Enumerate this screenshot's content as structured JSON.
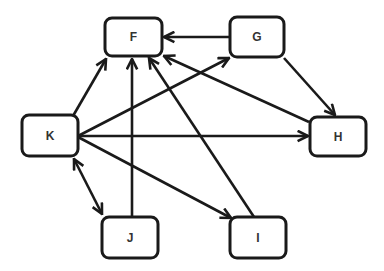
{
  "diagram": {
    "type": "directed-graph",
    "colors": {
      "stroke": "#1a1a1a",
      "node_fill": "#ffffff",
      "label": "#333333",
      "background": "#ffffff"
    },
    "nodes": [
      {
        "id": "F",
        "label": "F",
        "x": 105,
        "y": 18,
        "w": 57,
        "h": 38
      },
      {
        "id": "G",
        "label": "G",
        "x": 230,
        "y": 17,
        "w": 54,
        "h": 40
      },
      {
        "id": "K",
        "label": "K",
        "x": 22,
        "y": 115,
        "w": 56,
        "h": 41
      },
      {
        "id": "H",
        "label": "H",
        "x": 310,
        "y": 117,
        "w": 56,
        "h": 39
      },
      {
        "id": "J",
        "label": "J",
        "x": 102,
        "y": 217,
        "w": 56,
        "h": 41
      },
      {
        "id": "I",
        "label": "I",
        "x": 230,
        "y": 217,
        "w": 56,
        "h": 41
      }
    ],
    "edges": [
      {
        "from": "K",
        "to": "F",
        "x1": 73,
        "y1": 116,
        "x2": 106,
        "y2": 59,
        "bidirectional": false
      },
      {
        "from": "K",
        "to": "G",
        "x1": 78,
        "y1": 136,
        "x2": 229,
        "y2": 58,
        "bidirectional": false
      },
      {
        "from": "G",
        "to": "F",
        "x1": 230,
        "y1": 37,
        "x2": 164,
        "y2": 37,
        "bidirectional": false
      },
      {
        "from": "G",
        "to": "H",
        "x1": 284,
        "y1": 58,
        "x2": 335,
        "y2": 115,
        "bidirectional": false
      },
      {
        "from": "H",
        "to": "F",
        "x1": 309,
        "y1": 122,
        "x2": 164,
        "y2": 56,
        "bidirectional": false
      },
      {
        "from": "K",
        "to": "H",
        "x1": 78,
        "y1": 136,
        "x2": 308,
        "y2": 136,
        "bidirectional": false
      },
      {
        "from": "K",
        "to": "J",
        "x1": 74,
        "y1": 159,
        "x2": 102,
        "y2": 214,
        "bidirectional": true
      },
      {
        "from": "K",
        "to": "I",
        "x1": 78,
        "y1": 137,
        "x2": 231,
        "y2": 218,
        "bidirectional": false
      },
      {
        "from": "J",
        "to": "F",
        "x1": 132,
        "y1": 217,
        "x2": 132,
        "y2": 59,
        "bidirectional": false
      },
      {
        "from": "I",
        "to": "F",
        "x1": 254,
        "y1": 217,
        "x2": 149,
        "y2": 58,
        "bidirectional": false
      }
    ]
  }
}
